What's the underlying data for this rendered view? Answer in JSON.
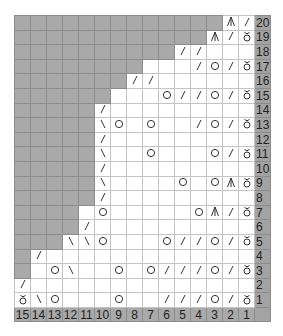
{
  "chart": {
    "stitch_count": 15,
    "row_count": 20,
    "colors": {
      "no_stitch": "#a9a9a9",
      "stitch": "#ffffff",
      "header": "#a3a3a3"
    },
    "symbols": {
      "/": "k2tog-icon",
      "\\": "ssk-icon",
      "O": "yarn-over-icon",
      "t": "twisted-stitch-icon",
      "A": "central-double-decrease-icon",
      "#": "no-stitch",
      "": "knit"
    },
    "column_numbers": [
      "15",
      "14",
      "13",
      "12",
      "11",
      "10",
      "9",
      "8",
      "7",
      "6",
      "5",
      "4",
      "3",
      "2",
      "1"
    ],
    "rows": [
      {
        "num": "20",
        "cells": [
          "#",
          "#",
          "#",
          "#",
          "#",
          "#",
          "#",
          "#",
          "#",
          "#",
          "#",
          "#",
          "#",
          "A",
          "/"
        ]
      },
      {
        "num": "19",
        "cells": [
          "#",
          "#",
          "#",
          "#",
          "#",
          "#",
          "#",
          "#",
          "#",
          "#",
          "#",
          "#",
          "A",
          "/",
          "t"
        ]
      },
      {
        "num": "18",
        "cells": [
          "#",
          "#",
          "#",
          "#",
          "#",
          "#",
          "#",
          "#",
          "#",
          "#",
          "/",
          "/",
          "",
          "",
          ""
        ]
      },
      {
        "num": "17",
        "cells": [
          "#",
          "#",
          "#",
          "#",
          "#",
          "#",
          "#",
          "#",
          "",
          "",
          "",
          "/",
          "O",
          "/",
          "t"
        ]
      },
      {
        "num": "16",
        "cells": [
          "#",
          "#",
          "#",
          "#",
          "#",
          "#",
          "#",
          "/",
          "/",
          "",
          "",
          "",
          "",
          "",
          ""
        ]
      },
      {
        "num": "15",
        "cells": [
          "#",
          "#",
          "#",
          "#",
          "#",
          "#",
          "",
          "",
          "",
          "O",
          "/",
          "/",
          "O",
          "/",
          "t"
        ]
      },
      {
        "num": "14",
        "cells": [
          "#",
          "#",
          "#",
          "#",
          "#",
          "/",
          "",
          "",
          "",
          "",
          "",
          "",
          "",
          "",
          ""
        ]
      },
      {
        "num": "13",
        "cells": [
          "#",
          "#",
          "#",
          "#",
          "#",
          "\\",
          "O",
          "",
          "O",
          "",
          "",
          "/",
          "O",
          "/",
          "t"
        ]
      },
      {
        "num": "12",
        "cells": [
          "#",
          "#",
          "#",
          "#",
          "#",
          "/",
          "",
          "",
          "",
          "",
          "",
          "",
          "",
          "",
          ""
        ]
      },
      {
        "num": "11",
        "cells": [
          "#",
          "#",
          "#",
          "#",
          "#",
          "\\",
          "",
          "",
          "O",
          "",
          "",
          "",
          "O",
          "/",
          "t"
        ]
      },
      {
        "num": "10",
        "cells": [
          "#",
          "#",
          "#",
          "#",
          "#",
          "/",
          "",
          "",
          "",
          "",
          "",
          "",
          "",
          "",
          ""
        ]
      },
      {
        "num": "9",
        "cells": [
          "#",
          "#",
          "#",
          "#",
          "#",
          "\\",
          "",
          "",
          "",
          "",
          "O",
          "",
          "O",
          "A",
          "t"
        ]
      },
      {
        "num": "8",
        "cells": [
          "#",
          "#",
          "#",
          "#",
          "#",
          "/",
          "",
          "",
          "",
          "",
          "",
          "",
          "",
          "",
          ""
        ]
      },
      {
        "num": "7",
        "cells": [
          "#",
          "#",
          "#",
          "#",
          "",
          "O",
          "",
          "",
          "",
          "",
          "",
          "O",
          "A",
          "/",
          "t"
        ]
      },
      {
        "num": "6",
        "cells": [
          "#",
          "#",
          "#",
          "#",
          "/",
          "",
          "",
          "",
          "",
          "",
          "",
          "",
          "",
          "",
          ""
        ]
      },
      {
        "num": "5",
        "cells": [
          "#",
          "#",
          "#",
          "\\",
          "\\",
          "O",
          "",
          "",
          "",
          "O",
          "/",
          "/",
          "O",
          "/",
          "t"
        ]
      },
      {
        "num": "4",
        "cells": [
          "#",
          "/",
          "",
          "",
          "",
          "",
          "",
          "",
          "",
          "",
          "",
          "",
          "",
          "",
          ""
        ]
      },
      {
        "num": "3",
        "cells": [
          "#",
          "",
          "O",
          "\\",
          "",
          "",
          "O",
          "",
          "O",
          "/",
          "/",
          "/",
          "O",
          "/",
          "t"
        ]
      },
      {
        "num": "2",
        "cells": [
          "/",
          "",
          "",
          "",
          "",
          "",
          "",
          "",
          "",
          "",
          "",
          "",
          "",
          "",
          ""
        ]
      },
      {
        "num": "1",
        "cells": [
          "t",
          "\\",
          "O",
          "",
          "",
          "",
          "O",
          "",
          "",
          "/",
          "/",
          "/",
          "O",
          "/",
          "t"
        ]
      }
    ]
  }
}
